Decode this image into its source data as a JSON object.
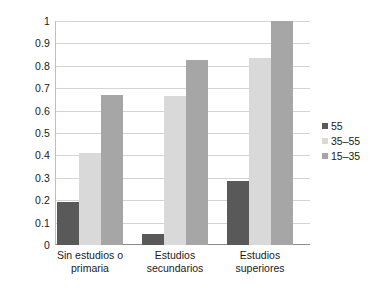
{
  "chart_data": {
    "type": "bar",
    "title": "",
    "subtitle": "",
    "xlabel": "",
    "ylabel": "",
    "ylim": [
      0,
      1
    ],
    "yticks": [
      "0",
      "0.1",
      "0.2",
      "0.3",
      "0.4",
      "0.5",
      "0.6",
      "0.7",
      "0.8",
      "0.9",
      "1"
    ],
    "ytick_values": [
      0,
      0.1,
      0.2,
      0.3,
      0.4,
      0.5,
      0.6,
      0.7,
      0.8,
      0.9,
      1
    ],
    "grid": true,
    "grid_axis": "y",
    "legend_position": "right",
    "categories": [
      "Sin estudios o primaria",
      "Estudios secundarios",
      "Estudios superiores"
    ],
    "category_lines": [
      [
        "Sin estudios o",
        "primaria"
      ],
      [
        "Estudios",
        "secundarios"
      ],
      [
        "Estudios",
        "superiores"
      ]
    ],
    "series": [
      {
        "name": "55",
        "color": "#595959",
        "values": [
          0.19,
          0.05,
          0.285
        ]
      },
      {
        "name": "35–55",
        "color": "#d9d9d9",
        "values": [
          0.41,
          0.665,
          0.835
        ]
      },
      {
        "name": "15–35",
        "color": "#a6a6a6",
        "values": [
          0.67,
          0.825,
          1.0
        ]
      }
    ]
  },
  "legend": {
    "items": [
      {
        "label": "55",
        "color": "#595959"
      },
      {
        "label": "35–55",
        "color": "#d9d9d9"
      },
      {
        "label": "15–35",
        "color": "#a6a6a6"
      }
    ]
  },
  "colors": {
    "gridline": "#d4d4d4",
    "axis": "#8c8c8c",
    "plot_background": "#ffffff",
    "text": "#1a1a1a"
  }
}
